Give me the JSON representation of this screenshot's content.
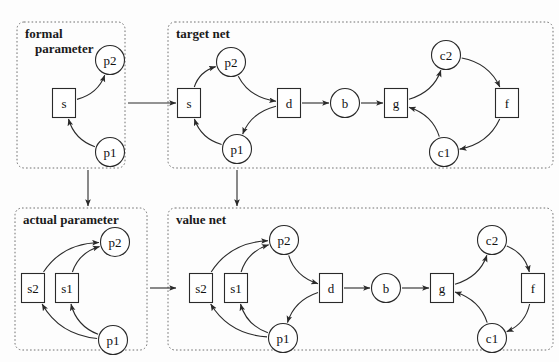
{
  "diagram": {
    "colors": {
      "stroke": "#2a2a2a",
      "box_stroke": "#707070",
      "background": "#fdfdfd",
      "label": "#1a1a1a"
    },
    "groups": [
      {
        "id": "formal-parameter",
        "label": "formal",
        "label_line2": "parameter",
        "x": 17,
        "y": 22,
        "w": 108,
        "h": 146
      },
      {
        "id": "target-net",
        "label": "target net",
        "label_line2": "",
        "x": 168,
        "y": 22,
        "w": 385,
        "h": 146
      },
      {
        "id": "actual-parameter",
        "label": "actual parameter",
        "label_line2": "",
        "x": 15,
        "y": 208,
        "w": 132,
        "h": 142
      },
      {
        "id": "value-net",
        "label": "value net",
        "label_line2": "",
        "x": 168,
        "y": 208,
        "w": 385,
        "h": 142
      }
    ],
    "nodes": [
      {
        "id": "fp-s",
        "label": "s",
        "shape": "box",
        "cx": 64,
        "cy": 103,
        "group": "formal-parameter"
      },
      {
        "id": "fp-p2",
        "label": "p2",
        "shape": "circle",
        "cx": 110,
        "cy": 60,
        "group": "formal-parameter"
      },
      {
        "id": "fp-p1",
        "label": "p1",
        "shape": "circle",
        "cx": 110,
        "cy": 152,
        "group": "formal-parameter"
      },
      {
        "id": "tn-s",
        "label": "s",
        "shape": "box",
        "cx": 189,
        "cy": 103,
        "group": "target-net"
      },
      {
        "id": "tn-p2",
        "label": "p2",
        "shape": "circle",
        "cx": 231,
        "cy": 62,
        "group": "target-net"
      },
      {
        "id": "tn-d",
        "label": "d",
        "shape": "box",
        "cx": 289,
        "cy": 103,
        "group": "target-net"
      },
      {
        "id": "tn-p1",
        "label": "p1",
        "shape": "circle",
        "cx": 237,
        "cy": 149,
        "group": "target-net"
      },
      {
        "id": "tn-b",
        "label": "b",
        "shape": "circle",
        "cx": 345,
        "cy": 103,
        "group": "target-net"
      },
      {
        "id": "tn-g",
        "label": "g",
        "shape": "box",
        "cx": 396,
        "cy": 103,
        "group": "target-net"
      },
      {
        "id": "tn-c2",
        "label": "c2",
        "shape": "circle",
        "cx": 446,
        "cy": 55,
        "group": "target-net"
      },
      {
        "id": "tn-f",
        "label": "f",
        "shape": "box",
        "cx": 507,
        "cy": 103,
        "group": "target-net"
      },
      {
        "id": "tn-c1",
        "label": "c1",
        "shape": "circle",
        "cx": 444,
        "cy": 152,
        "group": "target-net"
      },
      {
        "id": "ap-s2",
        "label": "s2",
        "shape": "box",
        "cx": 33,
        "cy": 288,
        "group": "actual-parameter"
      },
      {
        "id": "ap-s1",
        "label": "s1",
        "shape": "box",
        "cx": 67,
        "cy": 288,
        "group": "actual-parameter"
      },
      {
        "id": "ap-p2",
        "label": "p2",
        "shape": "circle",
        "cx": 115,
        "cy": 242,
        "group": "actual-parameter"
      },
      {
        "id": "ap-p1",
        "label": "p1",
        "shape": "circle",
        "cx": 113,
        "cy": 340,
        "group": "actual-parameter"
      },
      {
        "id": "vn-s2",
        "label": "s2",
        "shape": "box",
        "cx": 201,
        "cy": 288,
        "group": "value-net"
      },
      {
        "id": "vn-s1",
        "label": "s1",
        "shape": "box",
        "cx": 236,
        "cy": 288,
        "group": "value-net"
      },
      {
        "id": "vn-p2",
        "label": "p2",
        "shape": "circle",
        "cx": 284,
        "cy": 240,
        "group": "value-net"
      },
      {
        "id": "vn-d",
        "label": "d",
        "shape": "box",
        "cx": 331,
        "cy": 288,
        "group": "value-net"
      },
      {
        "id": "vn-p1",
        "label": "p1",
        "shape": "circle",
        "cx": 283,
        "cy": 338,
        "group": "value-net"
      },
      {
        "id": "vn-b",
        "label": "b",
        "shape": "circle",
        "cx": 386,
        "cy": 288,
        "group": "value-net"
      },
      {
        "id": "vn-g",
        "label": "g",
        "shape": "box",
        "cx": 442,
        "cy": 288,
        "group": "value-net"
      },
      {
        "id": "vn-c2",
        "label": "c2",
        "shape": "circle",
        "cx": 492,
        "cy": 240,
        "group": "value-net"
      },
      {
        "id": "vn-f",
        "label": "f",
        "shape": "box",
        "cx": 533,
        "cy": 288,
        "group": "value-net"
      },
      {
        "id": "vn-c1",
        "label": "c1",
        "shape": "circle",
        "cx": 492,
        "cy": 338,
        "group": "value-net"
      }
    ],
    "edges": [
      {
        "from": "fp-s",
        "to": "fp-p2",
        "kind": "arc"
      },
      {
        "from": "fp-p1",
        "to": "fp-s",
        "kind": "arc"
      },
      {
        "from": "tn-s",
        "to": "tn-p2",
        "kind": "arc"
      },
      {
        "from": "tn-p2",
        "to": "tn-d",
        "kind": "arc"
      },
      {
        "from": "tn-d",
        "to": "tn-p1",
        "kind": "arc"
      },
      {
        "from": "tn-p1",
        "to": "tn-s",
        "kind": "arc"
      },
      {
        "from": "tn-d",
        "to": "tn-b",
        "kind": "straight"
      },
      {
        "from": "tn-b",
        "to": "tn-g",
        "kind": "straight"
      },
      {
        "from": "tn-g",
        "to": "tn-c2",
        "kind": "arc"
      },
      {
        "from": "tn-c2",
        "to": "tn-f",
        "kind": "arc"
      },
      {
        "from": "tn-f",
        "to": "tn-c1",
        "kind": "arc"
      },
      {
        "from": "tn-c1",
        "to": "tn-g",
        "kind": "arc"
      },
      {
        "from": "ap-s2",
        "to": "ap-p2",
        "kind": "arc"
      },
      {
        "from": "ap-s1",
        "to": "ap-p2",
        "kind": "arc"
      },
      {
        "from": "ap-p1",
        "to": "ap-s2",
        "kind": "arc"
      },
      {
        "from": "ap-p1",
        "to": "ap-s1",
        "kind": "arc"
      },
      {
        "from": "vn-s2",
        "to": "vn-p2",
        "kind": "arc"
      },
      {
        "from": "vn-s1",
        "to": "vn-p2",
        "kind": "arc"
      },
      {
        "from": "vn-p2",
        "to": "vn-d",
        "kind": "arc"
      },
      {
        "from": "vn-d",
        "to": "vn-p1",
        "kind": "arc"
      },
      {
        "from": "vn-p1",
        "to": "vn-s2",
        "kind": "arc"
      },
      {
        "from": "vn-p1",
        "to": "vn-s1",
        "kind": "arc"
      },
      {
        "from": "vn-d",
        "to": "vn-b",
        "kind": "straight"
      },
      {
        "from": "vn-b",
        "to": "vn-g",
        "kind": "straight"
      },
      {
        "from": "vn-g",
        "to": "vn-c2",
        "kind": "arc"
      },
      {
        "from": "vn-c2",
        "to": "vn-f",
        "kind": "arc"
      },
      {
        "from": "vn-f",
        "to": "vn-c1",
        "kind": "arc"
      },
      {
        "from": "vn-c1",
        "to": "vn-g",
        "kind": "arc"
      }
    ],
    "group_links": [
      {
        "id": "formal-to-target",
        "kind": "horizontal",
        "x1": 128,
        "y1": 103,
        "x2": 176,
        "y2": 103
      },
      {
        "id": "formal-to-actual",
        "kind": "vertical",
        "x1": 88,
        "y1": 170,
        "x2": 88,
        "y2": 206
      },
      {
        "id": "target-to-value",
        "kind": "vertical",
        "x1": 237,
        "y1": 170,
        "x2": 237,
        "y2": 206
      },
      {
        "id": "actual-to-value",
        "kind": "horizontal",
        "x1": 150,
        "y1": 288,
        "x2": 176,
        "y2": 288
      }
    ]
  }
}
